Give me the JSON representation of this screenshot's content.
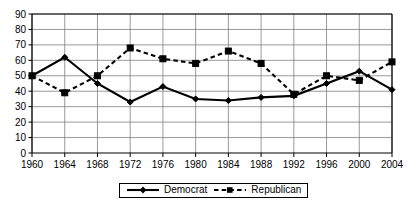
{
  "chart_data": {
    "type": "line",
    "title": "",
    "xlabel": "",
    "ylabel": "",
    "categories": [
      1960,
      1964,
      1968,
      1972,
      1976,
      1980,
      1984,
      1988,
      1992,
      1996,
      2000,
      2004
    ],
    "xtick_labels": [
      "1960",
      "1964",
      "1968",
      "1972",
      "1976",
      "1980",
      "1984",
      "1988",
      "1992",
      "1996",
      "2000",
      "2004"
    ],
    "ytick_labels": [
      "0",
      "10",
      "20",
      "30",
      "40",
      "50",
      "60",
      "70",
      "80",
      "90"
    ],
    "yticks": [
      0,
      10,
      20,
      30,
      40,
      50,
      60,
      70,
      80,
      90
    ],
    "ylim": [
      0,
      90
    ],
    "xlim": [
      1960,
      2004
    ],
    "grid": true,
    "legend_position": "bottom",
    "series": [
      {
        "name": "Democrat",
        "style": "solid",
        "marker": "diamond",
        "color": "#000000",
        "values": [
          50,
          62,
          45,
          33,
          43,
          35,
          34,
          36,
          37,
          45,
          53,
          41
        ]
      },
      {
        "name": "Republican",
        "style": "dashed",
        "marker": "square",
        "color": "#000000",
        "values": [
          50,
          39,
          50,
          68,
          61,
          58,
          66,
          58,
          38,
          50,
          47,
          59
        ]
      }
    ]
  },
  "legend": {
    "items": [
      {
        "label": "Democrat",
        "marker": "diamond-marker",
        "line": "solid-line"
      },
      {
        "label": "Republican",
        "marker": "square-marker",
        "line": "dashed-line"
      }
    ]
  }
}
